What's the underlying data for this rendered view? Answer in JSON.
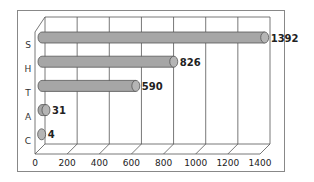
{
  "chart_data": {
    "type": "bar",
    "orientation": "horizontal",
    "style": "3d-cylinder",
    "title": "",
    "xlabel": "",
    "ylabel": "",
    "categories": [
      "S",
      "H",
      "T",
      "A",
      "C"
    ],
    "values": [
      1392,
      826,
      590,
      31,
      4
    ],
    "data_labels": [
      "1392",
      "826",
      "590",
      "31",
      "4"
    ],
    "xlim": [
      0,
      1400
    ],
    "x_ticks": [
      "0",
      "200",
      "400",
      "600",
      "800",
      "1000",
      "1200",
      "1400"
    ],
    "grid": true,
    "legend": "none",
    "colors": {
      "bar": "#a6a6a6",
      "bar_end": "#b5b5b5",
      "outline": "#555555",
      "grid": "#555555",
      "frame": "#888888"
    }
  }
}
